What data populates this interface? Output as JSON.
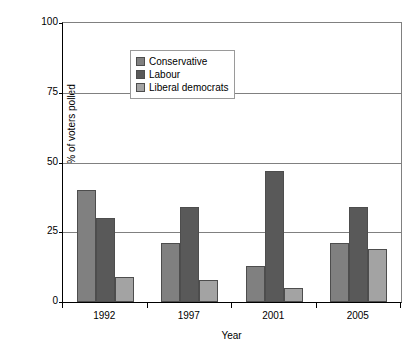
{
  "chart_data": {
    "type": "bar",
    "title": "",
    "xlabel": "Year",
    "ylabel": "% of voters polled",
    "categories": [
      "1992",
      "1997",
      "2001",
      "2005"
    ],
    "series": [
      {
        "name": "Conservative",
        "color": "#808080",
        "values": [
          40,
          21,
          13,
          21
        ]
      },
      {
        "name": "Labour",
        "color": "#595959",
        "values": [
          30,
          34,
          47,
          34
        ]
      },
      {
        "name": "Liberal democrats",
        "color": "#a3a3a3",
        "values": [
          9,
          8,
          5,
          19
        ]
      }
    ],
    "ylim": [
      0,
      100
    ],
    "yticks": [
      0,
      25,
      50,
      75,
      100
    ],
    "ytick_labels": [
      "0",
      "25",
      "50",
      "75",
      "100"
    ],
    "grid": true,
    "legend_position": "top-left",
    "colors": {
      "axis": "#000000",
      "grid": "#808080",
      "bar_border": "#4d4d4d",
      "background": "#ffffff"
    }
  }
}
